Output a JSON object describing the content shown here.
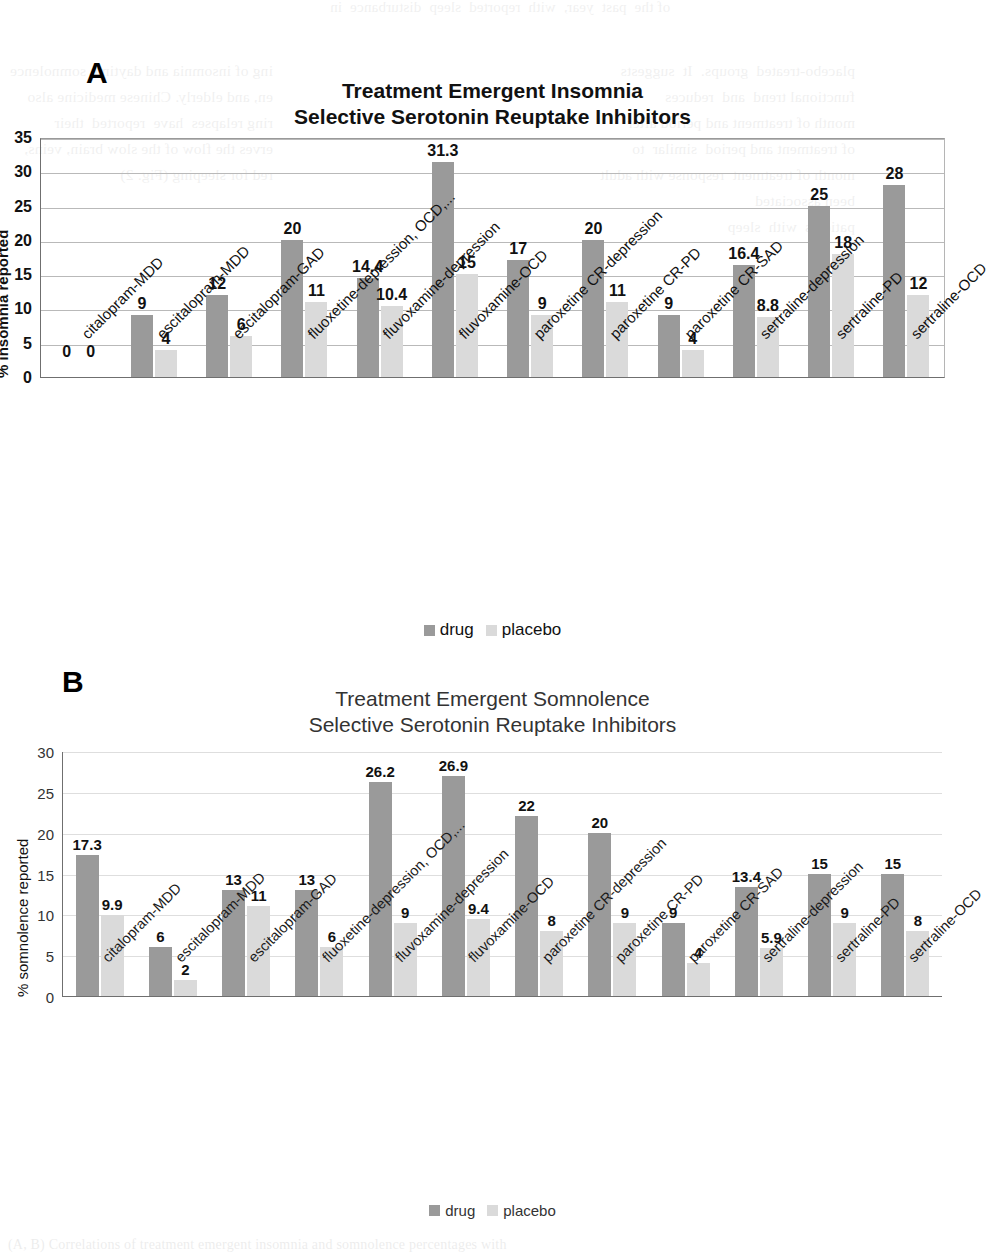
{
  "page": {
    "bleed_top": "of the  past  year,  with  reported  sleep  disturbance  in",
    "bleed_left": "ing of insomnia and daytime somnolence\nen, and elderly. Chinese medicine also\nring relapses  have  reported  their\nerves the flow of the slow brain, veins,\nred for sleeping (Fig. 2)",
    "bleed_right": "placebo-treated  groups.  It  suggests\nfunctional trend  and  reduces\nmonth of treatment and period after\nof treatment and period  similar  to\nmonth of treatment  response with adult\nbeen associated\npatients  with  sleep",
    "bleed_bottom": "(A, B) Correlations of treatment emergent insomnia and somnolence percentages with"
  },
  "panels": {
    "a_letter": "A",
    "b_letter": "B"
  },
  "legend": {
    "drug_label": "drug",
    "placebo_label": "placebo",
    "drug_color": "#9a9a9a",
    "placebo_color": "#dadada"
  },
  "chart_data": [
    {
      "id": "A",
      "type": "bar",
      "title": "Treatment Emergent Insomnia",
      "subtitle": "Selective Serotonin Reuptake Inhibitors",
      "xlabel": "",
      "ylabel": "% insomnia reported",
      "ylim": [
        0,
        35
      ],
      "yticks": [
        0,
        5,
        10,
        15,
        20,
        25,
        30,
        35
      ],
      "grid": true,
      "legend_position": "bottom",
      "categories": [
        "citalopram-MDD",
        "escitalopram-MDD",
        "escitalopram-GAD",
        "fluoxetine-depression, OCD,...",
        "fluvoxamine-depression",
        "fluvoxamine-OCD",
        "paroxetine CR-depression",
        "paroxetine CR-PD",
        "paroxetine CR-SAD",
        "sertraline-depression",
        "sertraline-PD",
        "sertraline-OCD"
      ],
      "series": [
        {
          "name": "drug",
          "color": "#9a9a9a",
          "values": [
            0,
            9,
            12,
            20,
            14.4,
            31.3,
            17,
            20,
            9,
            16.4,
            25,
            28
          ],
          "labels": [
            "0",
            "9",
            "12",
            "20",
            "14.4",
            "31.3",
            "17",
            "20",
            "9",
            "16.4",
            "25",
            "28"
          ]
        },
        {
          "name": "placebo",
          "color": "#dadada",
          "values": [
            0,
            4,
            6,
            11,
            10.4,
            15,
            9,
            11,
            4,
            8.8,
            18,
            12
          ],
          "labels": [
            "0",
            "4",
            "6",
            "11",
            "10.4",
            "15",
            "9",
            "11",
            "4",
            "8.8",
            "18",
            "12"
          ]
        }
      ]
    },
    {
      "id": "B",
      "type": "bar",
      "title": "Treatment Emergent Somnolence",
      "subtitle": "Selective Serotonin Reuptake Inhibitors",
      "xlabel": "",
      "ylabel": "% somnolence reported",
      "ylim": [
        0,
        30
      ],
      "yticks": [
        0,
        5,
        10,
        15,
        20,
        25,
        30
      ],
      "grid": true,
      "legend_position": "bottom",
      "categories": [
        "citalopram-MDD",
        "escitalopram-MDD",
        "escitalopram-GAD",
        "fluoxetine-depression, OCD,...",
        "fluvoxamine-depression",
        "fluvoxamine-OCD",
        "paroxetine CR-depression",
        "paroxetine CR-PD",
        "paroxetine CR-SAD",
        "sertraline-depression",
        "sertraline-PD",
        "sertraline-OCD"
      ],
      "series": [
        {
          "name": "drug",
          "color": "#9a9a9a",
          "values": [
            17.3,
            6,
            13,
            13,
            26.2,
            26.9,
            22,
            20,
            9,
            13.4,
            15,
            15
          ],
          "labels": [
            "17.3",
            "6",
            "13",
            "13",
            "26.2",
            "26.9",
            "22",
            "20",
            "9",
            "13.4",
            "15",
            "15"
          ]
        },
        {
          "name": "placebo",
          "color": "#dadada",
          "values": [
            9.9,
            2,
            11,
            6,
            9,
            9.4,
            8,
            9,
            4,
            5.9,
            9,
            8
          ],
          "labels": [
            "9.9",
            "2",
            "11",
            "6",
            "9",
            "9.4",
            "8",
            "9",
            "4",
            "5.9",
            "9",
            "8"
          ]
        }
      ]
    }
  ]
}
